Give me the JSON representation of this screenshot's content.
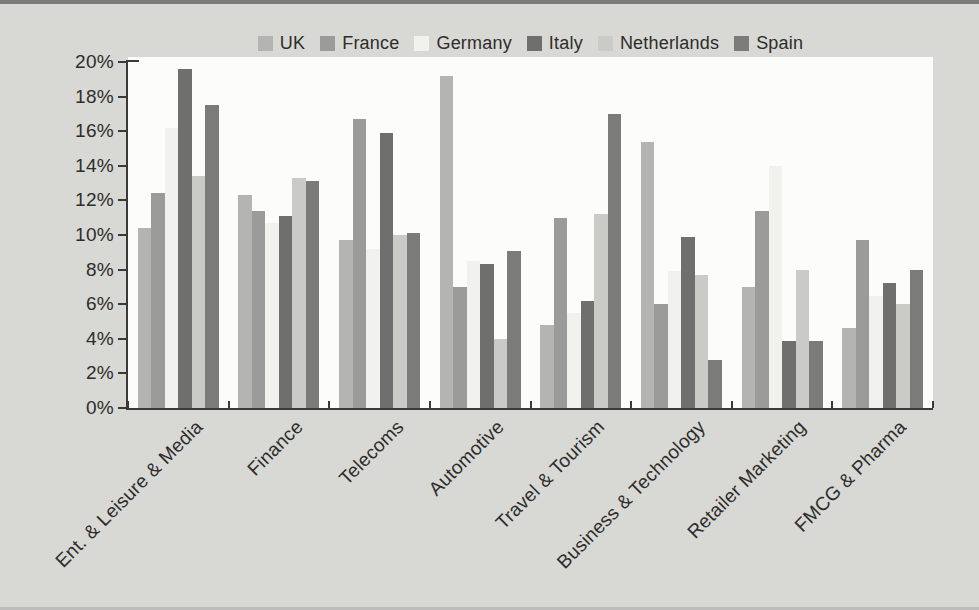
{
  "page": {
    "background": "#d8d8d5",
    "plot_background": "#fcfcfa",
    "axis_color": "#3a3a38",
    "text_color": "#2d2d2b"
  },
  "chart_data": {
    "type": "bar",
    "title": "",
    "xlabel": "",
    "ylabel": "",
    "ylim": [
      0,
      20
    ],
    "y_tick_step": 2,
    "y_tick_labels": [
      "0%",
      "2%",
      "4%",
      "6%",
      "8%",
      "10%",
      "12%",
      "14%",
      "16%",
      "18%",
      "20%"
    ],
    "grid": false,
    "legend_position": "top",
    "categories": [
      "Ent. & Leisure & Media",
      "Finance",
      "Telecoms",
      "Automotive",
      "Travel & Tourism",
      "Business & Technology",
      "Retailer Marketing",
      "FMCG & Pharma"
    ],
    "series": [
      {
        "name": "UK",
        "color": "#b4b4b2",
        "values": [
          10.4,
          12.3,
          9.7,
          19.2,
          4.8,
          15.4,
          7.0,
          4.6
        ]
      },
      {
        "name": "France",
        "color": "#9b9b99",
        "values": [
          12.4,
          11.4,
          16.7,
          7.0,
          11.0,
          6.0,
          11.4,
          9.7
        ]
      },
      {
        "name": "Germany",
        "color": "#f1f1ee",
        "values": [
          16.2,
          10.7,
          9.2,
          8.5,
          5.5,
          7.9,
          14.0,
          6.5
        ]
      },
      {
        "name": "Italy",
        "color": "#6f6f6d",
        "values": [
          19.6,
          11.1,
          15.9,
          8.3,
          6.2,
          9.9,
          3.9,
          7.2
        ]
      },
      {
        "name": "Netherlands",
        "color": "#cacac7",
        "values": [
          13.4,
          13.3,
          10.0,
          4.0,
          11.2,
          7.7,
          8.0,
          6.0
        ]
      },
      {
        "name": "Spain",
        "color": "#7b7b79",
        "values": [
          17.5,
          13.1,
          10.1,
          9.1,
          17.0,
          2.8,
          3.9,
          8.0
        ]
      }
    ]
  }
}
